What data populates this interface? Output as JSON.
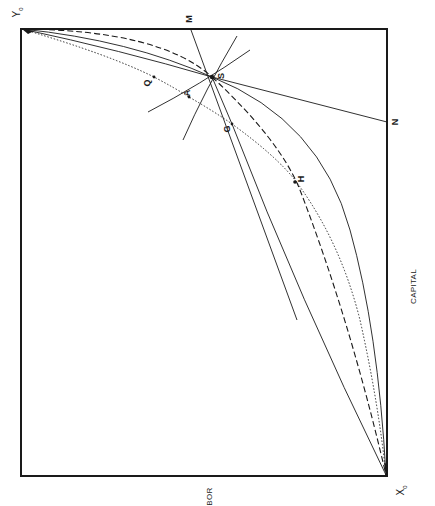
{
  "diagram": {
    "type": "edgeworth-box",
    "orientation": "rotated -90deg",
    "colors": {
      "ink": "#1a1a1a",
      "background": "#ffffff"
    },
    "corners": {
      "origin_y": {
        "label": "Y",
        "sub": "0"
      },
      "origin_x": {
        "label": "X",
        "sub": "0"
      }
    },
    "axis_labels": {
      "capital": "CAPITAL",
      "labor_partial": "BOR"
    },
    "points": {
      "S": "S",
      "Q": "Q",
      "A": "A",
      "G": "G",
      "H": "H",
      "M": "M",
      "N": "N"
    },
    "curves": [
      {
        "name": "contract-curve-dotted",
        "style": "dotted",
        "through": [
          "Y0",
          "Q",
          "A",
          "G",
          "H",
          "X0"
        ]
      },
      {
        "name": "dashed-curve",
        "style": "dashed",
        "through": [
          "Y0",
          "S",
          "H",
          "X0"
        ]
      },
      {
        "name": "solid-curve-inner",
        "style": "solid",
        "through": [
          "Y0",
          "S",
          "X0"
        ]
      },
      {
        "name": "solid-curve-outer",
        "style": "solid",
        "through": [
          "Y0",
          "S",
          "X0"
        ]
      },
      {
        "name": "line-MN-tangent",
        "style": "solid",
        "through": [
          "M",
          "S"
        ]
      },
      {
        "name": "line-SN",
        "style": "solid",
        "through": [
          "S",
          "N"
        ]
      }
    ]
  }
}
